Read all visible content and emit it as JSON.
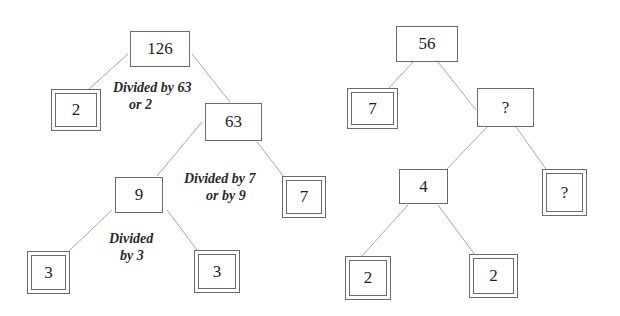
{
  "trees": [
    {
      "name": "factor-tree-126",
      "nodes": [
        {
          "id": "n126",
          "value": "126",
          "type": "composite",
          "x": 130,
          "y": 31,
          "w": 60,
          "h": 36
        },
        {
          "id": "n2a",
          "value": "2",
          "type": "prime",
          "x": 51,
          "y": 89,
          "w": 50,
          "h": 42
        },
        {
          "id": "n63",
          "value": "63",
          "type": "composite",
          "x": 205,
          "y": 103,
          "w": 57,
          "h": 38
        },
        {
          "id": "n9",
          "value": "9",
          "type": "composite",
          "x": 115,
          "y": 177,
          "w": 48,
          "h": 36
        },
        {
          "id": "n7a",
          "value": "7",
          "type": "prime",
          "x": 282,
          "y": 176,
          "w": 44,
          "h": 42
        },
        {
          "id": "n3a",
          "value": "3",
          "type": "prime",
          "x": 27,
          "y": 251,
          "w": 43,
          "h": 43
        },
        {
          "id": "n3b",
          "value": "3",
          "type": "prime",
          "x": 194,
          "y": 250,
          "w": 46,
          "h": 43
        }
      ],
      "edges": [
        {
          "from": "n126",
          "to": "n2a",
          "x1": 128,
          "y1": 54,
          "x2": 89,
          "y2": 89
        },
        {
          "from": "n126",
          "to": "n63",
          "x1": 192,
          "y1": 54,
          "x2": 230,
          "y2": 102
        },
        {
          "from": "n63",
          "to": "n9",
          "x1": 202,
          "y1": 122,
          "x2": 157,
          "y2": 176
        },
        {
          "from": "n63",
          "to": "n7a",
          "x1": 257,
          "y1": 142,
          "x2": 284,
          "y2": 177
        },
        {
          "from": "n9",
          "to": "n3a",
          "x1": 112,
          "y1": 210,
          "x2": 68,
          "y2": 252
        },
        {
          "from": "n9",
          "to": "n3b",
          "x1": 167,
          "y1": 210,
          "x2": 197,
          "y2": 250
        }
      ],
      "annotations": [
        {
          "id": "a1",
          "lines": [
            "Divided by 63",
            "or 2"
          ],
          "x": 113,
          "y": 79,
          "indent2": 16
        },
        {
          "id": "a2",
          "lines": [
            "Divided by 7",
            "or by 9"
          ],
          "x": 184,
          "y": 170,
          "indent2": 22
        },
        {
          "id": "a3",
          "lines": [
            "Divided",
            "by 3"
          ],
          "x": 109,
          "y": 230,
          "indent2": 11
        }
      ]
    },
    {
      "name": "factor-tree-56",
      "nodes": [
        {
          "id": "n56",
          "value": "56",
          "type": "composite",
          "x": 396,
          "y": 26,
          "w": 62,
          "h": 36
        },
        {
          "id": "n7b",
          "value": "7",
          "type": "prime",
          "x": 347,
          "y": 88,
          "w": 51,
          "h": 41
        },
        {
          "id": "nq1",
          "value": "?",
          "type": "composite",
          "x": 477,
          "y": 88,
          "w": 57,
          "h": 39
        },
        {
          "id": "n4",
          "value": "4",
          "type": "composite",
          "x": 399,
          "y": 169,
          "w": 49,
          "h": 35
        },
        {
          "id": "nq2",
          "value": "?",
          "type": "prime",
          "x": 542,
          "y": 169,
          "w": 45,
          "h": 47
        },
        {
          "id": "n2b",
          "value": "2",
          "type": "prime",
          "x": 345,
          "y": 256,
          "w": 46,
          "h": 44
        },
        {
          "id": "n2c",
          "value": "2",
          "type": "prime",
          "x": 469,
          "y": 254,
          "w": 49,
          "h": 44
        }
      ],
      "edges": [
        {
          "from": "n56",
          "to": "n7b",
          "x1": 413,
          "y1": 62,
          "x2": 388,
          "y2": 89
        },
        {
          "from": "n56",
          "to": "nq1",
          "x1": 438,
          "y1": 62,
          "x2": 476,
          "y2": 110
        },
        {
          "from": "nq1",
          "to": "n4",
          "x1": 487,
          "y1": 127,
          "x2": 446,
          "y2": 170
        },
        {
          "from": "nq1",
          "to": "nq2",
          "x1": 516,
          "y1": 127,
          "x2": 546,
          "y2": 169
        },
        {
          "from": "n4",
          "to": "n2b",
          "x1": 408,
          "y1": 205,
          "x2": 362,
          "y2": 256
        },
        {
          "from": "n4",
          "to": "n2c",
          "x1": 438,
          "y1": 205,
          "x2": 475,
          "y2": 255
        }
      ],
      "annotations": []
    }
  ],
  "colors": {
    "line": "#a8a8a8",
    "border": "#6a6a6a",
    "text": "#1e1e1e"
  }
}
